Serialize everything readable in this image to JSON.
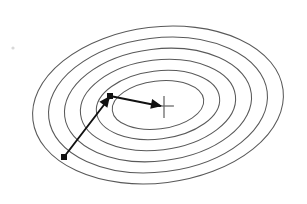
{
  "figure": {
    "background_color": "#ffffff",
    "width": 307,
    "height": 204,
    "contour_color": "#595959",
    "path_color": "#111111",
    "cross_color": "#6b6b6b"
  },
  "chart_data": {
    "type": "scatter",
    "title": "",
    "subtitle": "",
    "xlabel": "",
    "ylabel": "",
    "grid": false,
    "legend": null,
    "xlim": [
      0,
      307
    ],
    "ylim": [
      204,
      0
    ],
    "center": {
      "x": 158,
      "y": 105,
      "label": "minimum"
    },
    "contours": [
      {
        "level": 6,
        "rx": 126,
        "ry": 78,
        "rotation_deg": -7
      },
      {
        "level": 5,
        "rx": 110,
        "ry": 67,
        "rotation_deg": -7
      },
      {
        "level": 4,
        "rx": 94,
        "ry": 56,
        "rotation_deg": -7
      },
      {
        "level": 3,
        "rx": 78,
        "ry": 45,
        "rotation_deg": -7
      },
      {
        "level": 2,
        "rx": 62,
        "ry": 34,
        "rotation_deg": -7
      },
      {
        "level": 1,
        "rx": 46,
        "ry": 24,
        "rotation_deg": -7
      }
    ],
    "contour_count": 6,
    "path": {
      "name": "descent-path",
      "points": [
        {
          "x": 64,
          "y": 157,
          "marker": "square-dot",
          "label": "start"
        },
        {
          "x": 110,
          "y": 96,
          "marker": "arrowhead",
          "label": "intermediate"
        },
        {
          "x": 162,
          "y": 106,
          "marker": "arrowhead",
          "label": "end"
        }
      ],
      "segments": [
        {
          "from": [
            64,
            157
          ],
          "to": [
            110,
            96
          ],
          "arrow": true
        },
        {
          "from": [
            110,
            96
          ],
          "to": [
            162,
            106
          ],
          "arrow": true
        }
      ]
    },
    "center_marker": {
      "type": "cross",
      "x": 164,
      "y": 106,
      "arm_horizontal": 11,
      "arm_vertical": 15
    },
    "specks": [
      {
        "x": 13,
        "y": 48,
        "r": 1.6
      }
    ]
  }
}
